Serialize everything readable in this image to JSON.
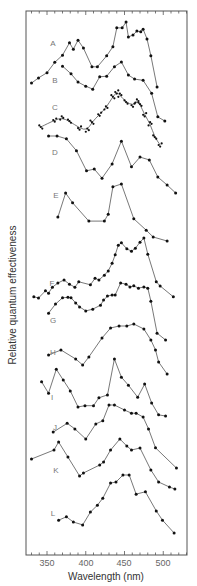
{
  "chart_data": {
    "type": "line",
    "title": "",
    "xlabel": "Wavelength (nm)",
    "ylabel": "Relative quantum effectiveness",
    "xlim": [
      323,
      531
    ],
    "x_ticks": [
      350,
      400,
      450,
      500
    ],
    "minor_tick_step": 10,
    "grid": false,
    "legend": "none (curves labeled A–L inline)",
    "note": "Stacked, vertically offset spectra; y-values are relative (0 = lowest point, 1 = highest point of each curve).",
    "series": [
      {
        "name": "A",
        "label_pos": [
          53,
          43
        ],
        "base_px": 87,
        "span_px": 65,
        "points": [
          [
            330,
            0.06
          ],
          [
            339,
            0.14
          ],
          [
            350,
            0.22
          ],
          [
            360,
            0.38
          ],
          [
            370,
            0.49
          ],
          [
            379,
            0.68
          ],
          [
            384,
            0.58
          ],
          [
            390,
            0.72
          ],
          [
            397,
            0.6
          ],
          [
            408,
            0.31
          ],
          [
            415,
            0.31
          ],
          [
            427,
            0.48
          ],
          [
            435,
            0.62
          ],
          [
            440,
            0.91
          ],
          [
            447,
            0.91
          ],
          [
            452,
            1.0
          ],
          [
            455,
            0.77
          ],
          [
            461,
            0.8
          ],
          [
            466,
            0.86
          ],
          [
            471,
            0.85
          ],
          [
            474,
            0.89
          ],
          [
            479,
            0.74
          ],
          [
            484,
            0.48
          ],
          [
            492,
            0.0
          ]
        ]
      },
      {
        "name": "B",
        "label_pos": [
          55,
          80
        ],
        "base_px": 121,
        "span_px": 59,
        "points": [
          [
            370,
            0.93
          ],
          [
            381,
            0.8
          ],
          [
            390,
            0.66
          ],
          [
            400,
            0.59
          ],
          [
            409,
            0.54
          ],
          [
            418,
            0.75
          ],
          [
            427,
            0.76
          ],
          [
            437,
            0.92
          ],
          [
            446,
            1.0
          ],
          [
            455,
            0.78
          ],
          [
            463,
            0.71
          ],
          [
            474,
            0.69
          ],
          [
            485,
            0.47
          ],
          [
            493,
            0.07
          ],
          [
            502,
            0.0
          ]
        ]
      },
      {
        "name": "C",
        "label_pos": [
          55,
          107
        ],
        "base_px": 145,
        "span_px": 53,
        "style": "dense scatter with smooth fit",
        "points": [
          [
            342,
            0.34
          ],
          [
            360,
            0.47
          ],
          [
            369,
            0.51
          ],
          [
            379,
            0.45
          ],
          [
            392,
            0.32
          ],
          [
            402,
            0.28
          ],
          [
            408,
            0.43
          ],
          [
            418,
            0.58
          ],
          [
            426,
            0.7
          ],
          [
            435,
            0.91
          ],
          [
            440,
            1.0
          ],
          [
            444,
            0.94
          ],
          [
            452,
            0.81
          ],
          [
            461,
            0.75
          ],
          [
            466,
            0.83
          ],
          [
            470,
            0.77
          ],
          [
            476,
            0.57
          ],
          [
            483,
            0.4
          ],
          [
            489,
            0.15
          ],
          [
            496,
            0.0
          ]
        ]
      },
      {
        "name": "D",
        "label_pos": [
          55,
          152
        ],
        "base_px": 193,
        "span_px": 57,
        "points": [
          [
            352,
            1.0
          ],
          [
            363,
            1.0
          ],
          [
            375,
            0.95
          ],
          [
            388,
            0.74
          ],
          [
            401,
            0.39
          ],
          [
            411,
            0.42
          ],
          [
            421,
            0.26
          ],
          [
            434,
            0.51
          ],
          [
            446,
            0.91
          ],
          [
            459,
            0.46
          ],
          [
            470,
            0.63
          ],
          [
            482,
            0.58
          ],
          [
            493,
            0.28
          ],
          [
            505,
            0.14
          ],
          [
            516,
            0.0
          ]
        ]
      },
      {
        "name": "E",
        "label_pos": [
          56,
          195
        ],
        "base_px": 241,
        "span_px": 57,
        "points": [
          [
            364,
            0.42
          ],
          [
            374,
            0.84
          ],
          [
            383,
            0.67
          ],
          [
            404,
            0.35
          ],
          [
            424,
            0.35
          ],
          [
            429,
            0.47
          ],
          [
            435,
            0.95
          ],
          [
            446,
            1.0
          ],
          [
            462,
            0.39
          ],
          [
            478,
            0.19
          ],
          [
            487,
            0.07
          ],
          [
            505,
            0.0
          ]
        ]
      },
      {
        "name": "F",
        "label_pos": [
          52,
          283
        ],
        "base_px": 298,
        "span_px": 60,
        "points": [
          [
            333,
            0.02
          ],
          [
            339,
            0.0
          ],
          [
            348,
            0.12
          ],
          [
            352,
            0.08
          ],
          [
            357,
            0.18
          ],
          [
            364,
            0.25
          ],
          [
            372,
            0.3
          ],
          [
            379,
            0.23
          ],
          [
            386,
            0.18
          ],
          [
            391,
            0.27
          ],
          [
            406,
            0.22
          ],
          [
            412,
            0.33
          ],
          [
            417,
            0.3
          ],
          [
            424,
            0.38
          ],
          [
            429,
            0.45
          ],
          [
            434,
            0.58
          ],
          [
            438,
            0.72
          ],
          [
            442,
            0.88
          ],
          [
            446,
            0.92
          ],
          [
            453,
            0.82
          ],
          [
            459,
            0.78
          ],
          [
            464,
            0.83
          ],
          [
            470,
            0.93
          ],
          [
            475,
            1.0
          ],
          [
            480,
            0.73
          ],
          [
            491,
            0.27
          ],
          [
            496,
            0.2
          ],
          [
            513,
            0.02
          ]
        ]
      },
      {
        "name": "G",
        "label_pos": [
          53,
          320
        ],
        "base_px": 340,
        "span_px": 57,
        "points": [
          [
            352,
            0.47
          ],
          [
            361,
            0.63
          ],
          [
            370,
            0.74
          ],
          [
            377,
            0.75
          ],
          [
            381,
            0.74
          ],
          [
            387,
            0.65
          ],
          [
            392,
            0.58
          ],
          [
            400,
            0.51
          ],
          [
            409,
            0.54
          ],
          [
            419,
            0.61
          ],
          [
            423,
            0.7
          ],
          [
            428,
            0.77
          ],
          [
            434,
            0.79
          ],
          [
            438,
            0.79
          ],
          [
            445,
            1.0
          ],
          [
            452,
            0.98
          ],
          [
            457,
            0.93
          ],
          [
            462,
            0.95
          ],
          [
            468,
            0.91
          ],
          [
            475,
            0.93
          ],
          [
            480,
            0.91
          ],
          [
            484,
            0.68
          ],
          [
            492,
            0.12
          ],
          [
            503,
            0.0
          ]
        ]
      },
      {
        "name": "H",
        "label_pos": [
          53,
          352
        ],
        "base_px": 374,
        "span_px": 50,
        "points": [
          [
            352,
            0.38
          ],
          [
            368,
            0.48
          ],
          [
            387,
            0.3
          ],
          [
            396,
            0.18
          ],
          [
            404,
            0.34
          ],
          [
            421,
            0.72
          ],
          [
            432,
            0.92
          ],
          [
            443,
            0.96
          ],
          [
            453,
            0.96
          ],
          [
            462,
            1.0
          ],
          [
            475,
            0.9
          ],
          [
            484,
            0.68
          ],
          [
            490,
            0.48
          ],
          [
            494,
            0.24
          ],
          [
            505,
            0.0
          ]
        ]
      },
      {
        "name": "I",
        "label_pos": [
          52,
          397
        ],
        "base_px": 416,
        "span_px": 57,
        "points": [
          [
            343,
            0.6
          ],
          [
            352,
            0.4
          ],
          [
            362,
            0.82
          ],
          [
            371,
            0.63
          ],
          [
            380,
            0.44
          ],
          [
            390,
            0.16
          ],
          [
            399,
            0.18
          ],
          [
            410,
            0.18
          ],
          [
            417,
            0.32
          ],
          [
            428,
            0.37
          ],
          [
            437,
            1.0
          ],
          [
            446,
            0.68
          ],
          [
            455,
            0.54
          ],
          [
            467,
            0.33
          ],
          [
            476,
            0.56
          ],
          [
            485,
            0.23
          ],
          [
            494,
            0.02
          ],
          [
            503,
            0.0
          ]
        ]
      },
      {
        "name": "J",
        "label_pos": [
          55,
          427
        ],
        "base_px": 468,
        "span_px": 63,
        "points": [
          [
            358,
            0.57
          ],
          [
            376,
            0.71
          ],
          [
            386,
            0.62
          ],
          [
            400,
            0.46
          ],
          [
            413,
            0.7
          ],
          [
            422,
            0.75
          ],
          [
            430,
            1.0
          ],
          [
            437,
            1.0
          ],
          [
            450,
            0.92
          ],
          [
            459,
            0.87
          ],
          [
            465,
            0.87
          ],
          [
            474,
            0.81
          ],
          [
            481,
            0.62
          ],
          [
            490,
            0.32
          ],
          [
            517,
            0.0
          ]
        ]
      },
      {
        "name": "K",
        "label_pos": [
          56,
          470
        ],
        "base_px": 489,
        "span_px": 50,
        "points": [
          [
            330,
            0.6
          ],
          [
            359,
            0.78
          ],
          [
            365,
            0.94
          ],
          [
            377,
            0.64
          ],
          [
            392,
            0.26
          ],
          [
            397,
            0.32
          ],
          [
            418,
            0.48
          ],
          [
            423,
            0.54
          ],
          [
            432,
            0.78
          ],
          [
            444,
            1.0
          ],
          [
            453,
            0.86
          ],
          [
            459,
            0.78
          ],
          [
            470,
            0.82
          ],
          [
            484,
            0.38
          ],
          [
            494,
            0.14
          ],
          [
            508,
            0.04
          ],
          [
            515,
            0.0
          ]
        ]
      },
      {
        "name": "L",
        "label_pos": [
          53,
          513
        ],
        "base_px": 533,
        "span_px": 58,
        "points": [
          [
            365,
            0.22
          ],
          [
            375,
            0.28
          ],
          [
            384,
            0.19
          ],
          [
            396,
            0.14
          ],
          [
            406,
            0.36
          ],
          [
            415,
            0.48
          ],
          [
            422,
            0.6
          ],
          [
            432,
            0.86
          ],
          [
            439,
            0.88
          ],
          [
            448,
            1.0
          ],
          [
            456,
            1.0
          ],
          [
            465,
            0.67
          ],
          [
            477,
            0.71
          ],
          [
            491,
            0.38
          ],
          [
            499,
            0.22
          ],
          [
            514,
            0.0
          ]
        ]
      }
    ]
  },
  "axes": {
    "xlabel": "Wavelength (nm)",
    "ylabel": "Relative quantum effectiveness",
    "tick_labels": [
      "350",
      "400",
      "450",
      "500"
    ]
  }
}
